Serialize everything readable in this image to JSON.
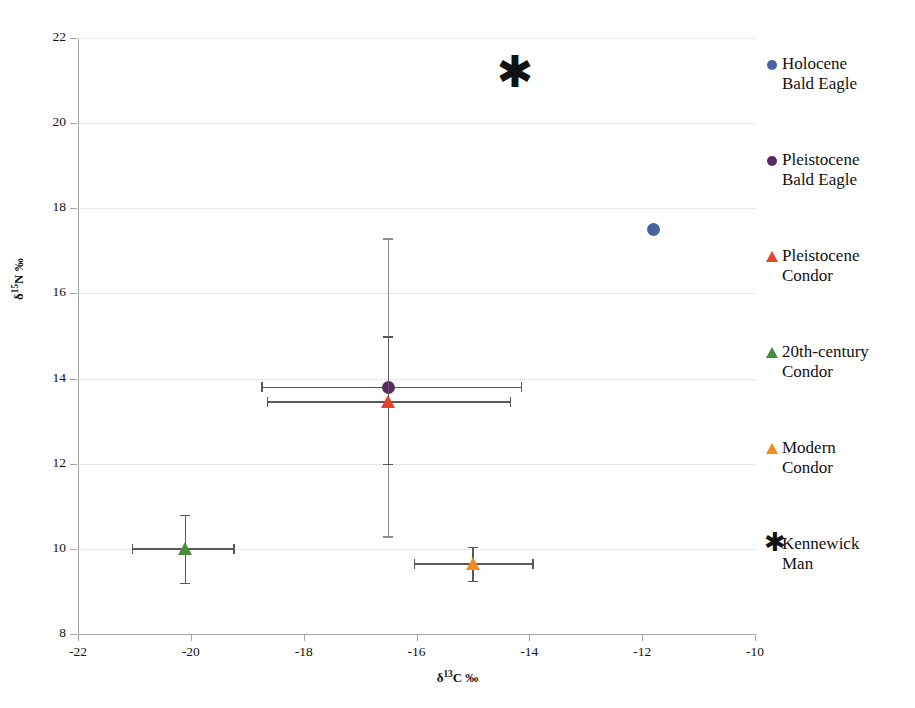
{
  "chart_data": {
    "type": "scatter",
    "title": "",
    "xlabel": "δ¹³C ‰",
    "ylabel": "δ¹⁵N ‰",
    "xlabel_parts": {
      "delta": "δ",
      "sup": "13",
      "rest": "C ‰"
    },
    "ylabel_parts": {
      "delta": "δ",
      "sup": "15",
      "rest": "N ‰"
    },
    "xlim": [
      -22,
      -10
    ],
    "ylim": [
      8,
      22
    ],
    "xticks": [
      -22,
      -20,
      -18,
      -16,
      -14,
      -12,
      -10
    ],
    "xtick_labels": [
      "-22",
      "-20",
      "-18",
      "-16",
      "-14",
      "-12",
      "-10"
    ],
    "yticks": [
      8,
      10,
      12,
      14,
      16,
      18,
      20,
      22
    ],
    "ytick_labels": [
      "8",
      "10",
      "12",
      "14",
      "16",
      "18",
      "20",
      "22"
    ],
    "grid": true,
    "legend_position": "right",
    "points": [
      {
        "name": "Holocene Bald Eagle",
        "marker": "circle",
        "color": "#4a63a0",
        "x": -11.8,
        "y": 17.5,
        "xerr": null,
        "yerr": null
      },
      {
        "name": "Pleistocene Bald Eagle",
        "marker": "circle",
        "color": "#5a2a63",
        "x": -16.5,
        "y": 13.8,
        "xerr": [
          -18.75,
          -14.15
        ],
        "yerr": [
          10.3,
          17.3
        ]
      },
      {
        "name": "Pleistocene Condor",
        "marker": "triangle",
        "color": "#e8422a",
        "x": -16.5,
        "y": 13.45,
        "xerr": [
          -18.65,
          -14.35
        ],
        "yerr": [
          12.0,
          15.0
        ]
      },
      {
        "name": "20th-century Condor",
        "marker": "triangle",
        "color": "#4a8b3f",
        "x": -20.1,
        "y": 10.0,
        "xerr": [
          -21.05,
          -19.25
        ],
        "yerr": [
          9.2,
          10.8
        ]
      },
      {
        "name": "Modern Condor",
        "marker": "triangle",
        "color": "#ee8b25",
        "x": -15.0,
        "y": 9.65,
        "xerr": [
          -16.05,
          -13.95
        ],
        "yerr": [
          9.25,
          10.05
        ]
      },
      {
        "name": "Kennewick Man",
        "marker": "asterisk",
        "color": "#111111",
        "x": -14.3,
        "y": 21.1,
        "xerr": null,
        "yerr": null
      }
    ]
  },
  "legend": {
    "items": [
      {
        "label_line1": "Holocene",
        "label_line2": "Bald Eagle",
        "marker": "circle",
        "color": "#4a63a0"
      },
      {
        "label_line1": "Pleistocene",
        "label_line2": "Bald Eagle",
        "marker": "circle",
        "color": "#5a2a63"
      },
      {
        "label_line1": "Pleistocene",
        "label_line2": "Condor",
        "marker": "triangle",
        "color": "#e8422a"
      },
      {
        "label_line1": "20th-century",
        "label_line2": "Condor",
        "marker": "triangle",
        "color": "#4a8b3f"
      },
      {
        "label_line1": "Modern",
        "label_line2": "Condor",
        "marker": "triangle",
        "color": "#ee8b25"
      },
      {
        "label_line1": "Kennewick",
        "label_line2": "Man",
        "marker": "asterisk",
        "color": "#111111"
      }
    ]
  },
  "markers": {
    "asterisk_glyph": "✱"
  }
}
